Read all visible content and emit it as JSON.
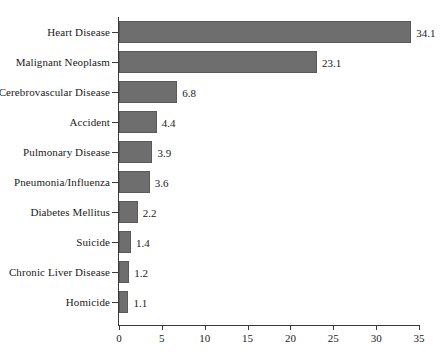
{
  "chart_data": {
    "type": "bar",
    "orientation": "horizontal",
    "title": "",
    "subtitle": "",
    "xlabel": "",
    "ylabel": "",
    "xlim": [
      0,
      35
    ],
    "xticks": [
      0,
      5,
      10,
      15,
      20,
      25,
      30,
      35
    ],
    "xtick_labels": [
      "0",
      "5",
      "10",
      "15",
      "20",
      "25",
      "30",
      "35"
    ],
    "grid": false,
    "legend": null,
    "categories": [
      "Heart Disease",
      "Malignant Neoplasm",
      "Cerebrovascular Disease",
      "Accident",
      "Pulmonary Disease",
      "Pneumonia/Influenza",
      "Diabetes Mellitus",
      "Suicide",
      "Chronic Liver Disease",
      "Homicide"
    ],
    "values": [
      34.1,
      23.1,
      6.8,
      4.4,
      3.9,
      3.6,
      2.2,
      1.4,
      1.2,
      1.1
    ],
    "value_labels": [
      "34.1",
      "23.1",
      "6.8",
      "4.4",
      "3.9",
      "3.6",
      "2.2",
      "1.4",
      "1.2",
      "1.1"
    ],
    "bar_color": "#6e6e6e",
    "bar_edge_color": "#5a5a5a",
    "axis_color": "#3b3b3b",
    "background": "#ffffff"
  }
}
